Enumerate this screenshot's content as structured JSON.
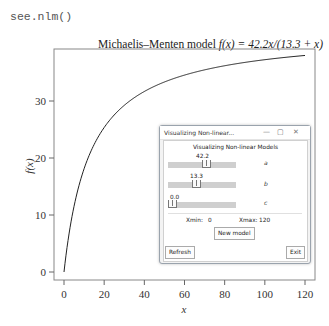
{
  "console": {
    "command": "see.nlm()"
  },
  "chart_data": {
    "type": "line",
    "title": "Michaelis–Menten model f(x) = 42.2x/(13.3 + x)",
    "title_parts": {
      "prefix": "Michaelis–Menten model ",
      "formula": "f(x) = 42.2x/(13.3 + x)"
    },
    "xlabel": "x",
    "ylabel": "f(x)",
    "xlim": [
      0,
      120
    ],
    "ylim": [
      0,
      38
    ],
    "x_ticks": [
      0,
      20,
      40,
      60,
      80,
      100,
      120
    ],
    "y_ticks": [
      0,
      10,
      20,
      30
    ],
    "grid": false,
    "series": [
      {
        "name": "f(x)",
        "function": "42.2*x/(13.3+x)",
        "x": [
          0,
          2,
          5,
          10,
          20,
          30,
          40,
          60,
          80,
          100,
          120
        ],
        "values": [
          0,
          5.5,
          11.5,
          18.1,
          25.3,
          29.2,
          31.7,
          34.5,
          36.2,
          37.2,
          38.0
        ]
      }
    ],
    "color": "#222222"
  },
  "window": {
    "titlebar": "Visualizing Non-linear...",
    "controls": [
      "—",
      "▢",
      "✕"
    ],
    "header": "Visualizing Non-linear Models",
    "sliders": [
      {
        "param": "a",
        "value": "42.2"
      },
      {
        "param": "b",
        "value": "13.3"
      },
      {
        "param": "c",
        "value": "0.0"
      }
    ],
    "xmin_label": "Xmin:",
    "xmin_value": "0",
    "xmax_label": "Xmax:",
    "xmax_value": "120",
    "new_model": "New model",
    "refresh": "Refresh",
    "exit": "Exit"
  }
}
